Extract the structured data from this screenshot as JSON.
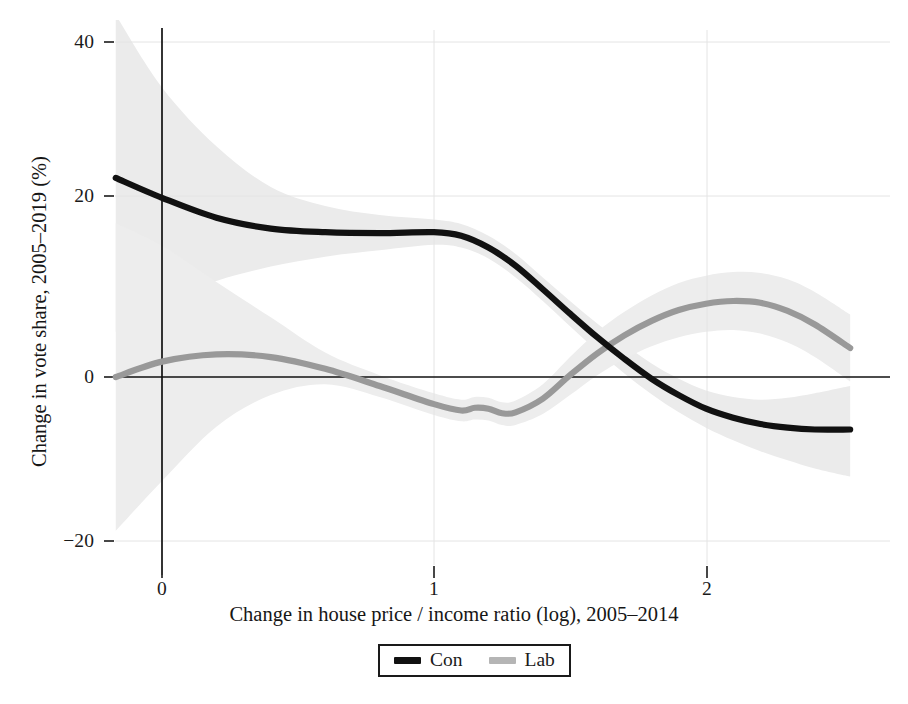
{
  "chart_data": {
    "type": "line",
    "title": "",
    "xlabel": "Change in house price / income ratio (log), 2005–2014",
    "ylabel": "Change in vote share, 2005–2019 (%)",
    "xlim": [
      -0.18,
      2.58
    ],
    "ylim": [
      -24,
      42
    ],
    "xticks": [
      0,
      1,
      2
    ],
    "xtick_labels": [
      "0",
      "1",
      "2"
    ],
    "yticks": [
      -20,
      0,
      20,
      40
    ],
    "ytick_labels": [
      "−20",
      "0",
      "20",
      "40"
    ],
    "grid": "light horizontal and vertical gridlines at ticks",
    "legend_position": "below axes, centered, boxed",
    "reference_lines": [
      {
        "name": "y-zero-line",
        "orientation": "horizontal",
        "value": 0,
        "color": "#111111"
      },
      {
        "name": "x-zero-line",
        "orientation": "vertical",
        "value": 0,
        "color": "#111111"
      }
    ],
    "series": [
      {
        "name": "Con",
        "label": "Con",
        "color": "#111111",
        "band_color": "#ebebeb",
        "x": [
          -0.17,
          0.0,
          0.2,
          0.4,
          0.6,
          0.8,
          1.0,
          1.1,
          1.2,
          1.3,
          1.4,
          1.5,
          1.6,
          1.7,
          1.8,
          1.9,
          2.0,
          2.1,
          2.2,
          2.3,
          2.4,
          2.53
        ],
        "values": [
          22.0,
          19.8,
          17.6,
          16.4,
          16.0,
          15.9,
          16.0,
          15.6,
          14.3,
          12.3,
          9.7,
          7.0,
          4.4,
          2.0,
          -0.2,
          -2.0,
          -3.5,
          -4.5,
          -5.2,
          -5.6,
          -5.8,
          -5.8
        ],
        "band_lower": [
          5.0,
          8.0,
          10.6,
          12.2,
          13.3,
          14.0,
          14.6,
          14.3,
          13.1,
          11.0,
          8.4,
          5.6,
          2.9,
          0.4,
          -1.9,
          -3.9,
          -5.6,
          -7.0,
          -8.2,
          -9.2,
          -10.1,
          -11.0
        ],
        "band_upper": [
          40.0,
          32.0,
          25.5,
          21.0,
          18.9,
          17.9,
          17.4,
          16.9,
          15.6,
          13.6,
          11.0,
          8.4,
          5.9,
          3.6,
          1.5,
          -0.2,
          -1.5,
          -2.2,
          -2.5,
          -2.3,
          -1.8,
          -1.0
        ]
      },
      {
        "name": "Lab",
        "label": "Lab",
        "color": "#999999",
        "band_color": "#ededed",
        "x": [
          -0.17,
          0.0,
          0.2,
          0.4,
          0.6,
          0.8,
          1.0,
          1.1,
          1.15,
          1.2,
          1.25,
          1.3,
          1.4,
          1.5,
          1.6,
          1.7,
          1.8,
          1.9,
          2.0,
          2.1,
          2.2,
          2.3,
          2.4,
          2.53
        ],
        "values": [
          0.0,
          1.7,
          2.5,
          2.2,
          0.9,
          -1.0,
          -3.0,
          -3.7,
          -3.4,
          -3.5,
          -4.0,
          -3.9,
          -2.4,
          0.2,
          2.6,
          4.6,
          6.2,
          7.4,
          8.1,
          8.4,
          8.2,
          7.3,
          5.8,
          3.2
        ],
        "band_lower": [
          -17.0,
          -11.5,
          -5.5,
          -2.0,
          -0.8,
          -2.2,
          -4.2,
          -4.9,
          -4.7,
          -4.8,
          -5.3,
          -5.3,
          -4.1,
          -2.0,
          0.2,
          2.0,
          3.4,
          4.4,
          5.0,
          5.2,
          4.8,
          3.8,
          2.2,
          -0.5
        ],
        "band_upper": [
          17.0,
          14.5,
          10.5,
          6.6,
          2.7,
          0.2,
          -1.8,
          -2.5,
          -2.2,
          -2.3,
          -2.8,
          -2.6,
          -0.8,
          2.2,
          5.0,
          7.2,
          9.0,
          10.4,
          11.2,
          11.6,
          11.5,
          10.8,
          9.4,
          6.9
        ]
      }
    ]
  },
  "axes": {
    "y_title": "Change in vote share, 2005–2019 (%)",
    "x_title": "Change in house price / income ratio (log), 2005–2014",
    "y_tick_labels": [
      "40",
      "20",
      "0",
      "−20"
    ],
    "x_tick_labels": [
      "0",
      "1",
      "2"
    ]
  },
  "legend": {
    "entries": [
      {
        "label": "Con",
        "color": "#111111"
      },
      {
        "label": "Lab",
        "color": "#a0a0a0"
      }
    ]
  },
  "colors": {
    "con_line": "#111111",
    "lab_line": "#999999",
    "con_band": "#ebebeb",
    "lab_band": "#ededed",
    "axis_line": "#111111",
    "grid_line": "#e2e2e2",
    "background": "#ffffff"
  }
}
